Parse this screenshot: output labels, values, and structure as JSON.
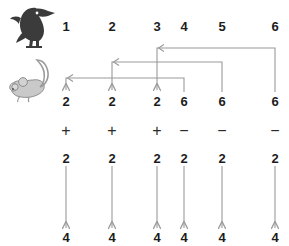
{
  "diagram": {
    "icons": [
      {
        "name": "bird-icon",
        "label": "bird",
        "x": 28,
        "y": 26,
        "fill": "#3a3a3a"
      },
      {
        "name": "mouse-icon",
        "label": "mouse",
        "x": 26,
        "y": 82,
        "fill": "#bdbdbd"
      }
    ],
    "colors": {
      "text": "#1c1c1c",
      "operator": "#2a2a2a",
      "arrow": "#9a9a9a",
      "bird_fill": "#3a3a3a",
      "mouse_fill": "#bdbdbd",
      "background": "#ffffff"
    },
    "rows": {
      "top": {
        "name": "bird-row",
        "y": 27,
        "cells": [
          {
            "value": "1",
            "x": 66
          },
          {
            "value": "2",
            "x": 112
          },
          {
            "value": "3",
            "x": 157
          },
          {
            "value": "4",
            "x": 184
          },
          {
            "value": "5",
            "x": 222
          },
          {
            "value": "6",
            "x": 275
          }
        ]
      },
      "middle": {
        "name": "mouse-row",
        "y": 102,
        "cells": [
          {
            "value": "2",
            "x": 66
          },
          {
            "value": "2",
            "x": 112
          },
          {
            "value": "2",
            "x": 157
          },
          {
            "value": "6",
            "x": 184
          },
          {
            "value": "6",
            "x": 222
          },
          {
            "value": "6",
            "x": 275
          }
        ]
      },
      "operators": {
        "name": "operator-row",
        "y": 131,
        "cells": [
          {
            "value": "+",
            "x": 66
          },
          {
            "value": "+",
            "x": 112
          },
          {
            "value": "+",
            "x": 157
          },
          {
            "value": "−",
            "x": 184
          },
          {
            "value": "−",
            "x": 222
          },
          {
            "value": "−",
            "x": 275
          }
        ]
      },
      "operands": {
        "name": "operand-row",
        "y": 159,
        "cells": [
          {
            "value": "2",
            "x": 66
          },
          {
            "value": "2",
            "x": 112
          },
          {
            "value": "2",
            "x": 157
          },
          {
            "value": "2",
            "x": 184
          },
          {
            "value": "2",
            "x": 222
          },
          {
            "value": "2",
            "x": 275
          }
        ]
      },
      "bottom": {
        "name": "result-row",
        "y": 238,
        "cells": [
          {
            "value": "4",
            "x": 66
          },
          {
            "value": "4",
            "x": 112
          },
          {
            "value": "4",
            "x": 157
          },
          {
            "value": "4",
            "x": 184
          },
          {
            "value": "4",
            "x": 222
          },
          {
            "value": "4",
            "x": 275
          }
        ]
      }
    },
    "routing_arrows": [
      {
        "name": "routing-arrow-6-to-3",
        "from_x": 275,
        "to_x": 157,
        "y": 48,
        "from_y": 92,
        "to_y": 92
      },
      {
        "name": "routing-arrow-6-to-2",
        "from_x": 222,
        "to_x": 112,
        "y": 62,
        "from_y": 92,
        "to_y": 92
      },
      {
        "name": "routing-arrow-6-to-1",
        "from_x": 184,
        "to_x": 66,
        "y": 78,
        "from_y": 92,
        "to_y": 92
      }
    ],
    "down_arrows": [
      {
        "name": "down-arrow-1",
        "x": 66,
        "y1": 165,
        "y2": 228
      },
      {
        "name": "down-arrow-2",
        "x": 112,
        "y1": 165,
        "y2": 228
      },
      {
        "name": "down-arrow-3",
        "x": 157,
        "y1": 165,
        "y2": 228
      },
      {
        "name": "down-arrow-4",
        "x": 184,
        "y1": 165,
        "y2": 228
      },
      {
        "name": "down-arrow-5",
        "x": 222,
        "y1": 165,
        "y2": 228
      },
      {
        "name": "down-arrow-6",
        "x": 275,
        "y1": 165,
        "y2": 228
      }
    ]
  }
}
